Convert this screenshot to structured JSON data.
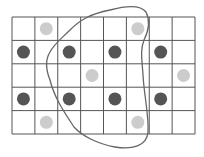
{
  "diagram": {
    "title": "",
    "grid": {
      "cols": 8,
      "rows": 5,
      "x0": 12,
      "y0": 17,
      "x1": 195,
      "y1": 134,
      "line_color": "#555555"
    },
    "dot_radius": 6.5,
    "colors": {
      "dark": "#555555",
      "light": "#cccccc",
      "curve": "#666666"
    },
    "dots": [
      {
        "row": 0,
        "col": 1,
        "shade": "light"
      },
      {
        "row": 0,
        "col": 5,
        "shade": "light"
      },
      {
        "row": 1,
        "col": 0,
        "shade": "dark"
      },
      {
        "row": 1,
        "col": 2,
        "shade": "dark"
      },
      {
        "row": 1,
        "col": 4,
        "shade": "dark"
      },
      {
        "row": 1,
        "col": 6,
        "shade": "dark"
      },
      {
        "row": 2,
        "col": 3,
        "shade": "light"
      },
      {
        "row": 2,
        "col": 7,
        "shade": "light"
      },
      {
        "row": 3,
        "col": 0,
        "shade": "dark"
      },
      {
        "row": 3,
        "col": 2,
        "shade": "dark"
      },
      {
        "row": 3,
        "col": 4,
        "shade": "dark"
      },
      {
        "row": 3,
        "col": 6,
        "shade": "dark"
      },
      {
        "row": 4,
        "col": 1,
        "shade": "light"
      },
      {
        "row": 4,
        "col": 5,
        "shade": "light"
      }
    ],
    "enclosure": {
      "label": "closed freehand curve enclosing middle region",
      "path": "M 146 12 C 150 20, 149 30, 144 40 C 140 50, 142 60, 143 75 C 144 95, 149 115, 148 132 C 147 146, 132 150, 115 147 C 98 144, 82 136, 74 127 C 64 112, 54 97, 50 80 C 46 70, 45 60, 50 52 C 54 44, 62 38, 70 30 C 80 20, 90 14, 110 10 C 125 6, 140 4, 146 12 Z"
    }
  }
}
